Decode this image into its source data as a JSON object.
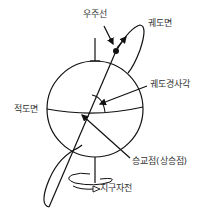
{
  "diagram": {
    "colors": {
      "stroke": "#111111",
      "text": "#333333",
      "background": "#ffffff"
    },
    "labels": {
      "cosmic_ray": "우주선",
      "orbital_plane": "궤도면",
      "orbital_inclination": "궤도경사각",
      "equatorial_plane": "적도면",
      "ascending_node": "승교점(상승점)",
      "earth_rotation": "지구자전"
    }
  }
}
